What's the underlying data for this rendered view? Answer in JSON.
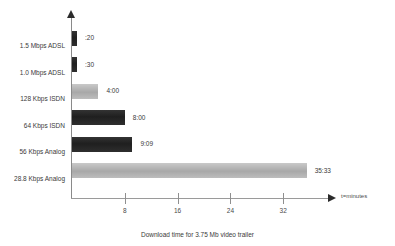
{
  "chart_data": {
    "type": "bar",
    "orientation": "horizontal",
    "title": "",
    "caption": "Download time for 3.75 Mb video trailer",
    "xlabel": "t=minutes",
    "ylabel": "",
    "xlim": [
      0,
      39
    ],
    "xticks": [
      8,
      16,
      24,
      32
    ],
    "xtick_labels": [
      "8",
      "16",
      "24",
      "32"
    ],
    "grid": false,
    "legend": false,
    "categories": [
      "1.5 Mbps ADSL",
      "1.0 Mbps ADSL",
      "128 Kbps ISDN",
      "64 Kbps ISDN",
      "56 Kbps Analog",
      "28.8 Kbps Analog"
    ],
    "values": [
      0.333,
      0.5,
      4.0,
      8.0,
      9.15,
      35.55
    ],
    "value_labels": [
      ":20",
      ":30",
      "4:00",
      "8:00",
      "9:09",
      "35:33"
    ],
    "bar_styles": [
      "dark",
      "dark",
      "light",
      "dark",
      "dark",
      "light"
    ],
    "colors": {
      "dark": "#2a2a2a",
      "light": "#b4b4b4",
      "axis": "#8f8f8f",
      "text": "#3a3a3a"
    }
  }
}
